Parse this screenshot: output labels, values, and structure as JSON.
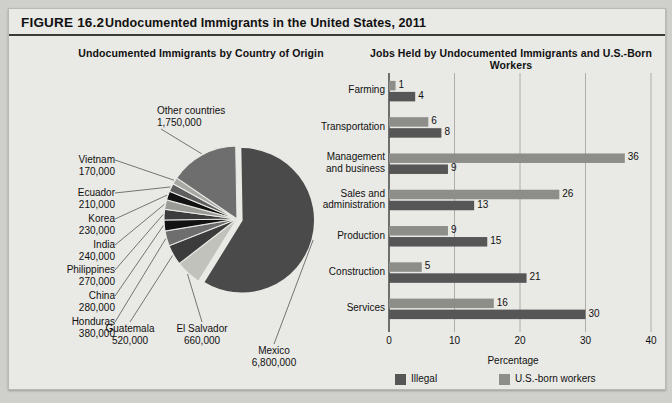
{
  "figure": {
    "number": "FIGURE 16.2",
    "title": "Undocumented Immigrants in the United States, 2011",
    "subtitle_left": "Undocumented Immigrants by Country of Origin",
    "subtitle_right": "Jobs Held by Undocumented Immigrants and U.S.-Born Workers"
  },
  "colors": {
    "page_bg": "#cfcfcb",
    "panel_bg": "#e9e9e5",
    "dark_gray": "#4a4a4a",
    "mid_gray": "#6e6e6e",
    "light_gray": "#b5b5b0",
    "black": "#111111",
    "text": "#111111"
  },
  "chart_data": [
    {
      "type": "pie",
      "title": "Undocumented Immigrants by Country of Origin",
      "legend": "none",
      "labels": [
        "Mexico",
        "Other countries",
        "Vietnam",
        "Ecuador",
        "Korea",
        "India",
        "Philippines",
        "China",
        "Honduras",
        "Guatemala",
        "El Salvador"
      ],
      "slices": [
        {
          "label": "Mexico",
          "value": 6800000,
          "value_text": "6,800,000",
          "color": "#4a4a4a",
          "exploded": true
        },
        {
          "label": "Other countries",
          "value": 1750000,
          "value_text": "1,750,000",
          "color": "#6e6e6e",
          "exploded": false
        },
        {
          "label": "Vietnam",
          "value": 170000,
          "value_text": "170,000",
          "color": "#a8a8a4",
          "exploded": false
        },
        {
          "label": "Ecuador",
          "value": 210000,
          "value_text": "210,000",
          "color": "#5f5f5f",
          "exploded": false
        },
        {
          "label": "Korea",
          "value": 230000,
          "value_text": "230,000",
          "color": "#121212",
          "exploded": false
        },
        {
          "label": "India",
          "value": 240000,
          "value_text": "240,000",
          "color": "#9a9a96",
          "exploded": false
        },
        {
          "label": "Philippines",
          "value": 270000,
          "value_text": "270,000",
          "color": "#3c3c3c",
          "exploded": false
        },
        {
          "label": "China",
          "value": 280000,
          "value_text": "280,000",
          "color": "#121212",
          "exploded": false
        },
        {
          "label": "Honduras",
          "value": 380000,
          "value_text": "380,000",
          "color": "#6e6e6e",
          "exploded": false
        },
        {
          "label": "Guatemala",
          "value": 520000,
          "value_text": "520,000",
          "color": "#3c3c3c",
          "exploded": false
        },
        {
          "label": "El Salvador",
          "value": 660000,
          "value_text": "660,000",
          "color": "#c2c2bd",
          "exploded": false
        }
      ]
    },
    {
      "type": "bar",
      "orientation": "horizontal",
      "title": "Jobs Held by Undocumented Immigrants and U.S.-Born Workers",
      "xlabel": "Percentage",
      "ylabel": "",
      "xlim": [
        0,
        40
      ],
      "xticks": [
        "0",
        "10",
        "20",
        "30",
        "40"
      ],
      "grid": true,
      "legend_position": "bottom",
      "categories": [
        "Farming",
        "Transportation",
        "Management and business",
        "Sales and administration",
        "Production",
        "Construction",
        "Services"
      ],
      "series": [
        {
          "name": "U.S.-born workers",
          "color": "#8d8d89",
          "values": [
            1,
            6,
            36,
            26,
            9,
            5,
            16
          ]
        },
        {
          "name": "Illegal",
          "color": "#565656",
          "values": [
            4,
            8,
            9,
            13,
            15,
            21,
            30
          ]
        }
      ]
    }
  ],
  "bar_categories_lines": [
    [
      "Farming"
    ],
    [
      "Transportation"
    ],
    [
      "Management",
      "and business"
    ],
    [
      "Sales and",
      "administration"
    ],
    [
      "Production"
    ],
    [
      "Construction"
    ],
    [
      "Services"
    ]
  ],
  "legend": {
    "items": [
      {
        "label": "Illegal",
        "color": "#565656"
      },
      {
        "label": "U.S.-born workers",
        "color": "#8d8d89"
      }
    ]
  },
  "caption": ""
}
